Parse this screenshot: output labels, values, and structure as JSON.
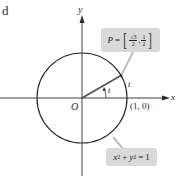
{
  "stray_glyph": "d",
  "axes": {
    "x_label": "x",
    "y_label": "y",
    "origin_label": "O"
  },
  "circle": {
    "equation": {
      "x": "x",
      "x_exp": "2",
      "plus": "+",
      "y": "y",
      "y_exp": "2",
      "equals": "=",
      "rhs": "1"
    },
    "radius": 1
  },
  "point_p": {
    "name": "P",
    "equals": "=",
    "x_num": "√3",
    "x_den": "2",
    "sep": ",",
    "y_num": "1",
    "y_den": "2"
  },
  "point_1_0": "(1, 0)",
  "angle_label": "t",
  "arc_label": "t",
  "colors": {
    "stroke": "#2b2b2b",
    "callout_bg": "#d9d9d9",
    "leader": "#bdbdbd"
  }
}
